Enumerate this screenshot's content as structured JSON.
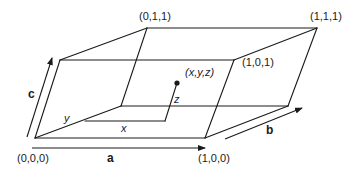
{
  "diagram": {
    "vertices": {
      "origin": {
        "label": "(0,0,0)"
      },
      "a_end": {
        "label": "(1,0,0)"
      },
      "top_back_left": {
        "label": "(0,1,1)"
      },
      "top_back_right": {
        "label": "(1,1,1)"
      },
      "top_front_right": {
        "label": "(1,0,1)"
      }
    },
    "vectors": {
      "a": {
        "label": "a"
      },
      "b": {
        "label": "b"
      },
      "c": {
        "label": "c"
      }
    },
    "point": {
      "label": "(x,y,z)",
      "components": {
        "x": "x",
        "y": "y",
        "z": "z"
      }
    },
    "colors": {
      "line": "#1a1a1a",
      "background": "#ffffff"
    }
  }
}
